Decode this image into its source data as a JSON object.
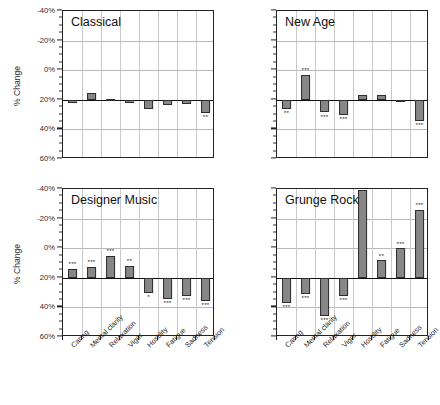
{
  "figure": {
    "ylabel": "% Change",
    "y_ticks": [
      "60%",
      "40%",
      "20%",
      "0%",
      "-20%",
      "-40%"
    ],
    "categories": [
      "Caring",
      "Mental clarity",
      "Relaxation",
      "Vigor",
      "Hostility",
      "Fatigue",
      "Sadness",
      "Tension"
    ]
  },
  "panels": [
    {
      "title": "Classical"
    },
    {
      "title": "New Age"
    },
    {
      "title": "Designer Music"
    },
    {
      "title": "Grunge Rock"
    }
  ],
  "chart_data": [
    {
      "type": "bar",
      "title": "Classical",
      "xlabel": "",
      "ylabel": "% Change",
      "ylim": [
        -40,
        60
      ],
      "yticks": [
        -40,
        -20,
        0,
        20,
        40,
        60
      ],
      "grid": true,
      "legend": "none",
      "categories": [
        "Caring",
        "Mental clarity",
        "Relaxation",
        "Vigor",
        "Hostility",
        "Fatigue",
        "Sadness",
        "Tension"
      ],
      "values": [
        -2.5,
        4.5,
        0.8,
        -2.5,
        -6.5,
        -3.5,
        -3.0,
        -9.0
      ],
      "significance": [
        "",
        "",
        "",
        "",
        "",
        "",
        "",
        "**"
      ]
    },
    {
      "type": "bar",
      "title": "New Age",
      "xlabel": "",
      "ylabel": "",
      "ylim": [
        -40,
        60
      ],
      "yticks": [
        -40,
        -20,
        0,
        20,
        40,
        60
      ],
      "grid": true,
      "legend": "none",
      "categories": [
        "Caring",
        "Mental clarity",
        "Relaxation",
        "Vigor",
        "Hostility",
        "Fatigue",
        "Sadness",
        "Tension"
      ],
      "values": [
        -6.0,
        17.0,
        -8.5,
        -10.0,
        3.0,
        3.0,
        0.0,
        -14.0
      ],
      "significance": [
        "**",
        "***",
        "***",
        "***",
        "",
        "",
        "",
        "***"
      ]
    },
    {
      "type": "bar",
      "title": "Designer Music",
      "xlabel": "",
      "ylabel": "% Change",
      "ylim": [
        -40,
        60
      ],
      "yticks": [
        -40,
        -20,
        0,
        20,
        40,
        60
      ],
      "grid": true,
      "legend": "none",
      "categories": [
        "Caring",
        "Mental clarity",
        "Relaxation",
        "Vigor",
        "Hostility",
        "Fatigue",
        "Sadness",
        "Tension"
      ],
      "values": [
        6.0,
        7.5,
        15.0,
        8.0,
        -10.0,
        -14.5,
        -12.0,
        -15.5
      ],
      "significance": [
        "***",
        "***",
        "***",
        "**",
        "*",
        "***",
        "***",
        "***"
      ]
    },
    {
      "type": "bar",
      "title": "Grunge Rock",
      "xlabel": "",
      "ylabel": "",
      "ylim": [
        -40,
        60
      ],
      "yticks": [
        -40,
        -20,
        0,
        20,
        40,
        60
      ],
      "grid": true,
      "legend": "none",
      "categories": [
        "Caring",
        "Mental clarity",
        "Relaxation",
        "Vigor",
        "Hostility",
        "Fatigue",
        "Sadness",
        "Tension"
      ],
      "values": [
        -17.0,
        -11.0,
        -26.0,
        -12.0,
        59.0,
        12.0,
        20.0,
        46.0
      ],
      "significance": [
        "***",
        "***",
        "***",
        "***",
        "***",
        "**",
        "***",
        "***"
      ]
    }
  ]
}
